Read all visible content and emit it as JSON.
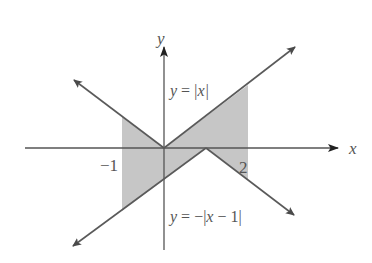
{
  "figure": {
    "type": "graph of absolute value functions with shaded region between curves",
    "axes": {
      "x_label": "x",
      "y_label": "y",
      "tick_labels": [
        {
          "value": -1,
          "text": "−1"
        },
        {
          "value": 2,
          "text": "2"
        }
      ]
    },
    "curves": [
      {
        "id": "upper",
        "equation_text": "y = |x|",
        "label_parts": {
          "y": "y",
          "eq": " =",
          "abs": "|x|"
        }
      },
      {
        "id": "lower",
        "equation_text": "y = −|x − 1|",
        "label_parts": {
          "y": "y",
          "eq": " = −|",
          "x": "x",
          "rest": " − 1|"
        }
      }
    ],
    "shaded_region": {
      "x_from": -1,
      "x_to": 2,
      "between": [
        "y = |x|",
        "y = −|x − 1|"
      ]
    },
    "colors": {
      "line": "#5a5a5a",
      "shade": "#c6c6c6",
      "label": "#555555"
    }
  }
}
